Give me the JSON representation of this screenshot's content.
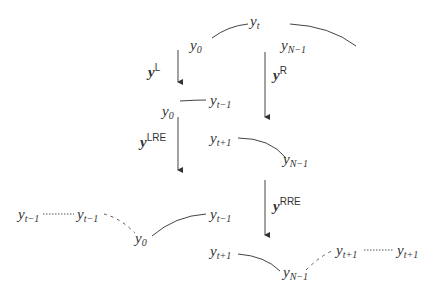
{
  "diagram": {
    "nodes": {
      "top_center": {
        "base": "y",
        "sub": "t"
      },
      "top_left": {
        "base": "y",
        "sub": "0"
      },
      "top_right": {
        "base": "y",
        "sub": "N−1"
      },
      "l_left": {
        "base": "y",
        "sub": "0"
      },
      "l_right": {
        "base": "y",
        "sub": "t−1"
      },
      "r_left": {
        "base": "y",
        "sub": "t+1"
      },
      "r_right": {
        "base": "y",
        "sub": "N−1"
      },
      "lre_far1": {
        "base": "y",
        "sub": "t−1"
      },
      "lre_far2": {
        "base": "y",
        "sub": "t−1"
      },
      "lre_left": {
        "base": "y",
        "sub": "0"
      },
      "lre_right": {
        "base": "y",
        "sub": "t−1"
      },
      "rre_left": {
        "base": "y",
        "sub": "t+1"
      },
      "rre_right": {
        "base": "y",
        "sub": "N−1"
      },
      "rre_far1": {
        "base": "y",
        "sub": "t+1"
      },
      "rre_far2": {
        "base": "y",
        "sub": "t+1"
      }
    },
    "arrows": {
      "L": {
        "base": "y",
        "sup": "L"
      },
      "R": {
        "base": "y",
        "sup": "R"
      },
      "LRE": {
        "base": "y",
        "sup": "LRE"
      },
      "RRE": {
        "base": "y",
        "sup": "RRE"
      }
    }
  }
}
